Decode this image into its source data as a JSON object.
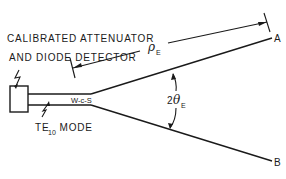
{
  "figure": {
    "type": "waveguide horn antenna measurement schematic",
    "labels": {
      "detector_line1": "CALIBRATED ATTENUATOR",
      "detector_line2": "AND DIODE DETECTOR",
      "mode_prefix": "TE",
      "mode_sub": "10",
      "mode_suffix": " MODE",
      "waveguide_text": "W-c-S",
      "slant_length_symbol": "ρ",
      "slant_length_sub": "E",
      "angle_prefix": "2",
      "angle_symbol": "θ",
      "angle_sub": "E",
      "point_a": "A",
      "point_b": "B"
    },
    "colors": {
      "ink": "#1a1a1a",
      "background": "#ffffff"
    }
  }
}
